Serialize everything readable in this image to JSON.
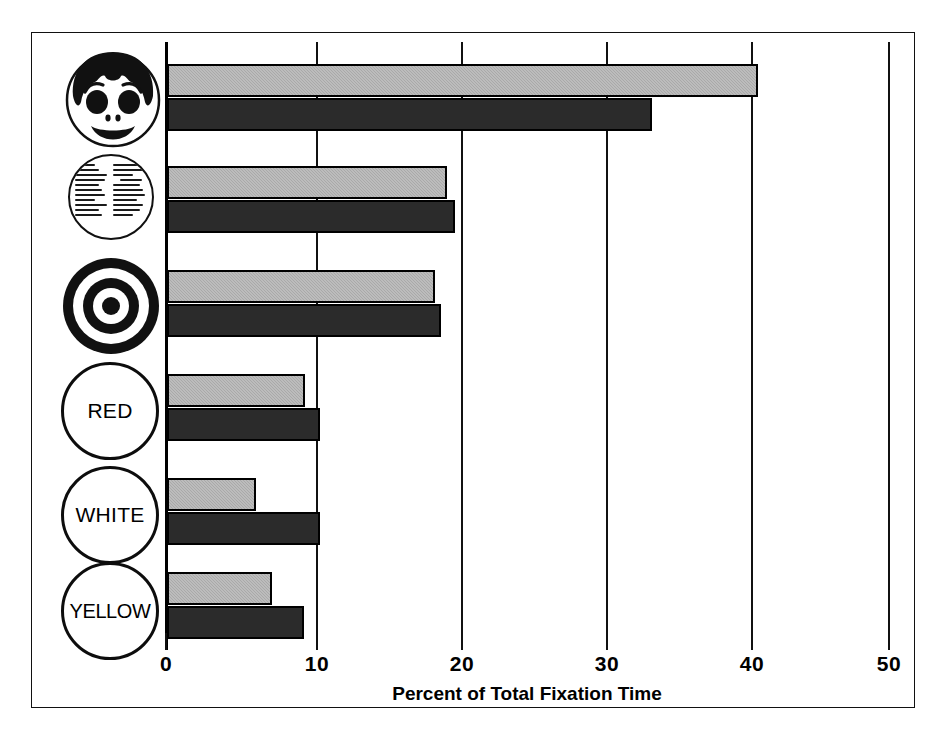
{
  "figure": {
    "has_outer_frame": true,
    "background_color": "#ffffff"
  },
  "chart_data": {
    "type": "bar",
    "orientation": "horizontal",
    "title": "",
    "xlabel": "Percent of Total Fixation Time",
    "ylabel": "",
    "xlim": [
      0,
      50
    ],
    "xticks": [
      0,
      10,
      20,
      30,
      40,
      50
    ],
    "xtick_labels": [
      "0",
      "10",
      "20",
      "30",
      "40",
      "50"
    ],
    "grid": "vertical gridlines at each x tick",
    "legend": "none shown",
    "categories": [
      "smiling face picture",
      "block of printed text",
      "bullseye target",
      "RED",
      "WHITE",
      "YELLOW"
    ],
    "category_icon_names": [
      "face-icon",
      "text-page-icon",
      "bullseye-icon",
      "circle-label-red",
      "circle-label-white",
      "circle-label-yellow"
    ],
    "category_labels": [
      "",
      "",
      "",
      "RED",
      "WHITE",
      "YELLOW"
    ],
    "series": [
      {
        "name": "upper bar",
        "color": "#a9a9a9",
        "fill": "light gray stipple",
        "values": [
          41.0,
          19.4,
          18.6,
          9.6,
          6.2,
          7.3
        ]
      },
      {
        "name": "lower bar",
        "color": "#2b2b2b",
        "fill": "solid dark",
        "values": [
          33.6,
          20.0,
          19.0,
          10.6,
          10.6,
          9.5
        ]
      }
    ]
  },
  "axis": {
    "x_title": "Percent of Total Fixation Time",
    "ticks": [
      "0",
      "10",
      "20",
      "30",
      "40",
      "50"
    ]
  },
  "icons": {
    "face": {
      "name": "face-icon",
      "description": "smiling cartoon face with dark hair"
    },
    "text_page": {
      "name": "text-page-icon",
      "description": "circle filled with two columns of small printed text"
    },
    "bullseye": {
      "name": "bullseye-icon",
      "description": "concentric ring target"
    },
    "red": {
      "name": "circle-label-red",
      "label": "RED"
    },
    "white": {
      "name": "circle-label-white",
      "label": "WHITE"
    },
    "yellow": {
      "name": "circle-label-yellow",
      "label": "YELLOW"
    }
  }
}
